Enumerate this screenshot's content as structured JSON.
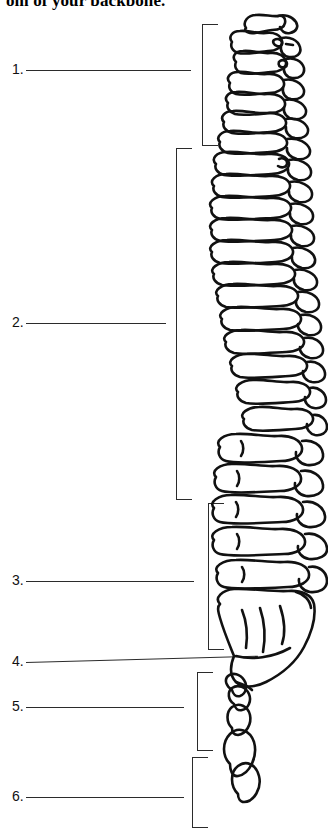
{
  "page": {
    "heading_text": "om of your backbone.",
    "background_color": "#ffffff",
    "ink_color": "#2b2b2b"
  },
  "labels": [
    {
      "number": "1.",
      "blank_text": "",
      "top": 60,
      "left": 12,
      "line_width": 165
    },
    {
      "number": "2.",
      "blank_text": "",
      "top": 313,
      "left": 12,
      "line_width": 140
    },
    {
      "number": "3.",
      "blank_text": "",
      "top": 571,
      "left": 12,
      "line_width": 168
    },
    {
      "number": "4.",
      "blank_text": "",
      "top": 652,
      "left": 12,
      "line_width": 232
    },
    {
      "number": "5.",
      "blank_text": "",
      "top": 697,
      "left": 12,
      "line_width": 158
    },
    {
      "number": "6.",
      "blank_text": "",
      "top": 787,
      "left": 12,
      "line_width": 158
    }
  ],
  "brackets": [
    {
      "region": "cervical",
      "for_label": "1.",
      "left": 202,
      "top": 24,
      "width": 16,
      "height": 122
    },
    {
      "region": "thoracic",
      "for_label": "2.",
      "left": 176,
      "top": 148,
      "width": 16,
      "height": 352
    },
    {
      "region": "lumbar",
      "for_label": "3.",
      "left": 208,
      "top": 503,
      "width": 16,
      "height": 147
    },
    {
      "region": "sacrum",
      "for_label": "5.",
      "left": 197,
      "top": 672,
      "width": 16,
      "height": 79
    },
    {
      "region": "coccyx",
      "for_label": "6.",
      "left": 192,
      "top": 757,
      "width": 16,
      "height": 71
    }
  ],
  "figure": {
    "name": "human-vertebral-column-lateral-view"
  }
}
